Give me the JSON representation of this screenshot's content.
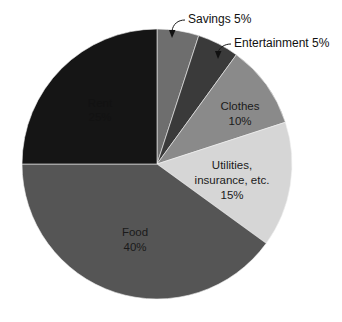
{
  "chart_data": {
    "type": "pie",
    "title": "",
    "subtitle": "",
    "xlabel": "",
    "ylabel": "",
    "legend_position": "none",
    "grid": false,
    "total": 100,
    "units": "%",
    "categories": [
      "Savings",
      "Entertainment",
      "Clothes",
      "Utilities, insurance, etc.",
      "Food",
      "Rent"
    ],
    "values": [
      5,
      5,
      10,
      15,
      40,
      25
    ],
    "colors": [
      "#6e6e6e",
      "#3a3a3a",
      "#8a8a8a",
      "#d6d6d6",
      "#555555",
      "#151515"
    ],
    "start_angle_deg": 0,
    "direction": "clockwise",
    "slices": [
      {
        "name": "Savings",
        "value": 5,
        "label_line1": "Savings 5%",
        "label_line2": "",
        "label_line3": "",
        "color": "#6e6e6e",
        "label_style": "callout",
        "start_deg": 0,
        "end_deg": 18
      },
      {
        "name": "Entertainment",
        "value": 5,
        "label_line1": "Entertainment 5%",
        "label_line2": "",
        "label_line3": "",
        "color": "#3a3a3a",
        "label_style": "callout",
        "start_deg": 18,
        "end_deg": 36
      },
      {
        "name": "Clothes",
        "value": 10,
        "label_line1": "Clothes",
        "label_line2": "10%",
        "label_line3": "",
        "color": "#8a8a8a",
        "label_style": "inside",
        "start_deg": 36,
        "end_deg": 72
      },
      {
        "name": "Utilities, insurance, etc.",
        "value": 15,
        "label_line1": "Utilities,",
        "label_line2": "insurance, etc.",
        "label_line3": "15%",
        "color": "#d6d6d6",
        "label_style": "inside",
        "start_deg": 72,
        "end_deg": 126
      },
      {
        "name": "Food",
        "value": 40,
        "label_line1": "Food",
        "label_line2": "40%",
        "label_line3": "",
        "color": "#555555",
        "label_style": "inside",
        "start_deg": 126,
        "end_deg": 270
      },
      {
        "name": "Rent",
        "value": 25,
        "label_line1": "Rent",
        "label_line2": "25%",
        "label_line3": "",
        "color": "#151515",
        "label_style": "inside-dark",
        "start_deg": 270,
        "end_deg": 360
      }
    ]
  },
  "figure": {
    "background": "#ffffff",
    "center_x": 157,
    "center_y": 164,
    "radius": 135
  }
}
